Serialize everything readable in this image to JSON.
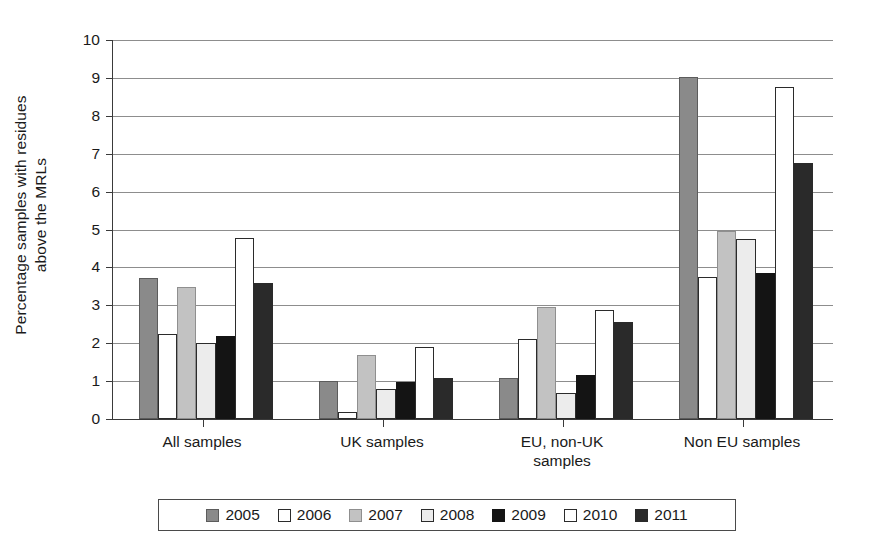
{
  "chart_data": {
    "type": "bar",
    "title": "",
    "xlabel": "",
    "ylabel": "Percentage samples with residues above the MRLs",
    "ylabel_line1": "Percentage samples with residues",
    "ylabel_line2": "above the MRLs",
    "ylim": [
      0,
      10
    ],
    "ytick_labels": [
      "10",
      "9",
      "8",
      "7",
      "6",
      "5",
      "4",
      "3",
      "2",
      "1",
      "0"
    ],
    "yticks": [
      10,
      9,
      8,
      7,
      6,
      5,
      4,
      3,
      2,
      1,
      0
    ],
    "grid": true,
    "legend_position": "bottom",
    "categories": [
      "All samples",
      "UK samples",
      "EU, non-UK samples",
      "Non EU samples"
    ],
    "category_labels": [
      {
        "line1": "All samples",
        "line2": ""
      },
      {
        "line1": "UK samples",
        "line2": ""
      },
      {
        "line1": "EU, non-UK",
        "line2": "samples"
      },
      {
        "line1": "Non EU samples",
        "line2": ""
      }
    ],
    "series": [
      {
        "name": "2005",
        "color": "#8a8a8a",
        "values": [
          3.72,
          1.0,
          1.07,
          9.03
        ]
      },
      {
        "name": "2006",
        "color": "#ffffff",
        "values": [
          2.25,
          0.18,
          2.1,
          3.75
        ]
      },
      {
        "name": "2007",
        "color": "#c2c2c2",
        "values": [
          3.48,
          1.68,
          2.95,
          4.95
        ]
      },
      {
        "name": "2008",
        "color": "#ececec",
        "values": [
          2.0,
          0.78,
          0.68,
          4.75
        ]
      },
      {
        "name": "2009",
        "color": "#141414",
        "values": [
          2.2,
          0.97,
          1.17,
          3.85
        ]
      },
      {
        "name": "2010",
        "color": "#ffffff",
        "values": [
          4.78,
          1.9,
          2.87,
          8.75
        ]
      },
      {
        "name": "2011",
        "color": "#2a2a2a",
        "values": [
          3.58,
          1.08,
          2.55,
          6.75
        ]
      }
    ]
  },
  "legend": {
    "items": [
      {
        "label": "2005",
        "swatch": "legend-swatch-2005"
      },
      {
        "label": "2006",
        "swatch": "legend-swatch-2006"
      },
      {
        "label": "2007",
        "swatch": "legend-swatch-2007"
      },
      {
        "label": "2008",
        "swatch": "legend-swatch-2008"
      },
      {
        "label": "2009",
        "swatch": "legend-swatch-2009"
      },
      {
        "label": "2010",
        "swatch": "legend-swatch-2010"
      },
      {
        "label": "2011",
        "swatch": "legend-swatch-2011"
      }
    ]
  }
}
